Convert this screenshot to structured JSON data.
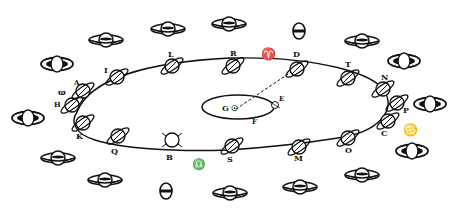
{
  "diagram": {
    "colors": {
      "ink": "#111111",
      "paper": "#ffffff"
    },
    "sun": {
      "label": "G",
      "symbol": "☉"
    },
    "earth_orbit_labels": {
      "E": "E",
      "F": "F"
    },
    "orbit_positions": [
      {
        "label": "L"
      },
      {
        "label": "R"
      },
      {
        "label": "D"
      },
      {
        "label": "T"
      },
      {
        "label": "N"
      },
      {
        "label": "P"
      },
      {
        "label": "C"
      },
      {
        "label": "O"
      },
      {
        "label": "M"
      },
      {
        "label": "S"
      },
      {
        "label": "B"
      },
      {
        "label": "Q"
      },
      {
        "label": "K"
      },
      {
        "label": "H"
      },
      {
        "label": "A"
      },
      {
        "label": "I"
      }
    ],
    "zodiac_symbols": {
      "aries": "♈",
      "libra": "♎",
      "cancer": "♋",
      "capricorn": "♑"
    },
    "outer_label_left": "ϖ"
  }
}
